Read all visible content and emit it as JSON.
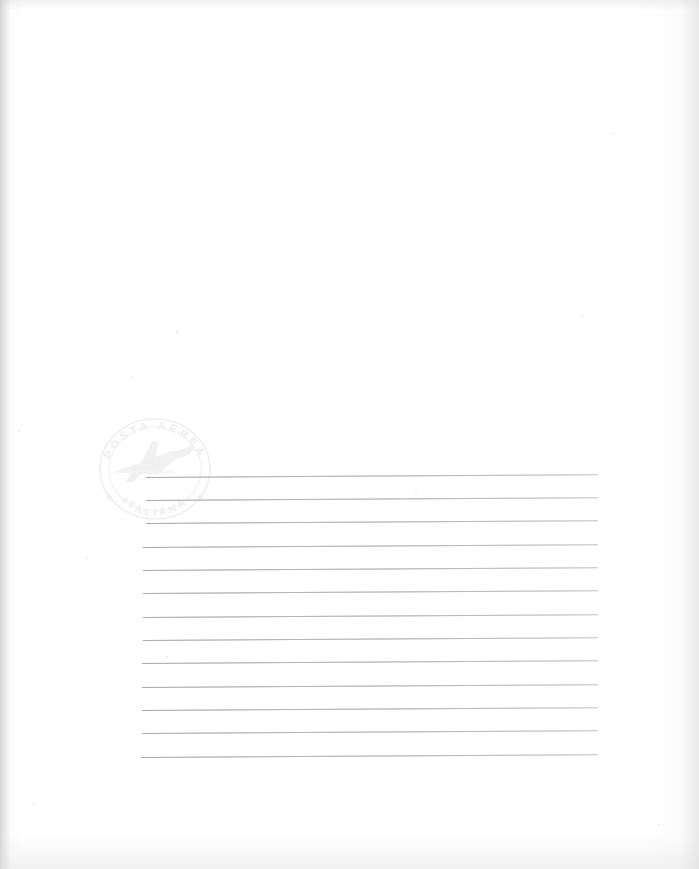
{
  "document": {
    "kind": "scanned-letter-paper",
    "title": "Blank ruled airmail letter sheet",
    "page_width": 699,
    "page_height": 869,
    "paper_color": "#ffffff",
    "edge_shadow_color": "#e3e3e3"
  },
  "stamp": {
    "name": "airmail-cachet",
    "shape": "circle",
    "top_arc_text": "POSTA AEREA",
    "bottom_arc_text": "ITALIANA",
    "left_star": "★",
    "right_star": "★",
    "center_motif": "airplane",
    "ink_color": "#e6e6e6",
    "position": {
      "x": 96,
      "y": 416,
      "width": 118,
      "height": 106
    }
  },
  "ruled_lines": {
    "count": 13,
    "color": "#c3c3c3",
    "thickness_px": 1,
    "tilt_deg": -0.35,
    "lines": [
      {
        "index": 1,
        "x": 146,
        "y": 477,
        "length": 452
      },
      {
        "index": 2,
        "x": 146,
        "y": 500,
        "length": 452
      },
      {
        "index": 3,
        "x": 146,
        "y": 523,
        "length": 452
      },
      {
        "index": 4,
        "x": 143,
        "y": 547,
        "length": 455
      },
      {
        "index": 5,
        "x": 143,
        "y": 570,
        "length": 455
      },
      {
        "index": 6,
        "x": 143,
        "y": 593,
        "length": 455
      },
      {
        "index": 7,
        "x": 143,
        "y": 617,
        "length": 455
      },
      {
        "index": 8,
        "x": 143,
        "y": 640,
        "length": 455
      },
      {
        "index": 9,
        "x": 142,
        "y": 663,
        "length": 456
      },
      {
        "index": 10,
        "x": 142,
        "y": 687,
        "length": 456
      },
      {
        "index": 11,
        "x": 142,
        "y": 710,
        "length": 456
      },
      {
        "index": 12,
        "x": 142,
        "y": 733,
        "length": 456
      },
      {
        "index": 13,
        "x": 141,
        "y": 757,
        "length": 457
      }
    ]
  },
  "specks": [
    {
      "x": 18,
      "y": 430,
      "size": 2
    },
    {
      "x": 176,
      "y": 331,
      "size": 3
    },
    {
      "x": 131,
      "y": 376,
      "size": 2
    },
    {
      "x": 415,
      "y": 492,
      "size": 2
    },
    {
      "x": 581,
      "y": 315,
      "size": 2
    },
    {
      "x": 86,
      "y": 557,
      "size": 2
    },
    {
      "x": 166,
      "y": 656,
      "size": 2
    },
    {
      "x": 612,
      "y": 133,
      "size": 2
    },
    {
      "x": 33,
      "y": 803,
      "size": 2
    },
    {
      "x": 658,
      "y": 824,
      "size": 2
    }
  ]
}
